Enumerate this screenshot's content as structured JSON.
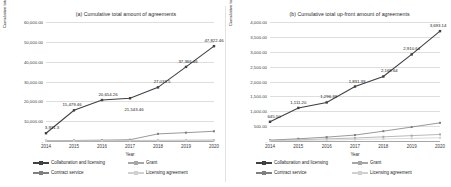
{
  "figure": {
    "background": "#ffffff",
    "series_colors": {
      "collaboration_and_licensing": "#404040",
      "contract_service": "#7f7f7f",
      "grant": "#a6a6a6",
      "licensing_agreement": "#d0d0d0"
    }
  },
  "chart_data": [
    {
      "type": "line",
      "panel": "a",
      "title": "(a) Cumulative total amount of agreements",
      "xlabel": "Year",
      "ylabel": "Cumulative total amount, $ million",
      "categories": [
        "2014",
        "2015",
        "2016",
        "2017",
        "2018",
        "2019",
        "2020"
      ],
      "ylim": [
        0,
        60000
      ],
      "yticks": [
        "-",
        "10,000.00",
        "20,000.00",
        "30,000.00",
        "40,000.00",
        "50,000.00",
        "60,000.00"
      ],
      "ytick_values": [
        0,
        10000,
        20000,
        30000,
        40000,
        50000,
        60000
      ],
      "grid": true,
      "legend_position": "bottom",
      "series": [
        {
          "name": "Collaboration and licensing",
          "color": "#404040",
          "values": [
            3931.3,
            15479.46,
            20654.26,
            21543.46,
            27033.5,
            37366.46,
            47822.46
          ],
          "data_labels": [
            "3,931.3",
            "15,479.46",
            "20,654.26",
            "21,543.46",
            "27,033.5",
            "37,366.46",
            "47,822.46"
          ]
        },
        {
          "name": "Contract service",
          "color": "#7f7f7f",
          "values": [
            120,
            260,
            420,
            640,
            3600,
            4200,
            4900
          ],
          "data_labels": []
        },
        {
          "name": "Grant",
          "color": "#a6a6a6",
          "values": [
            60,
            120,
            190,
            260,
            330,
            400,
            470
          ],
          "data_labels": []
        },
        {
          "name": "Licensing agreement",
          "color": "#d0d0d0",
          "values": [
            30,
            70,
            110,
            150,
            190,
            230,
            270
          ],
          "data_labels": []
        }
      ]
    },
    {
      "type": "line",
      "panel": "b",
      "title": "(b) Cumulative total up-front amount of agreements",
      "xlabel": "Year",
      "ylabel": "Cumulative total up-front amount, $ million",
      "categories": [
        "2014",
        "2015",
        "2016",
        "2017",
        "2018",
        "2019",
        "2020"
      ],
      "ylim": [
        0,
        4000
      ],
      "yticks": [
        "-",
        "500.00",
        "1,000.00",
        "1,500.00",
        "2,000.00",
        "2,500.00",
        "3,000.00",
        "3,500.00",
        "4,000.00"
      ],
      "ytick_values": [
        0,
        500,
        1000,
        1500,
        2000,
        2500,
        3000,
        3500,
        4000
      ],
      "grid": true,
      "legend_position": "bottom",
      "series": [
        {
          "name": "Collaboration and licensing",
          "color": "#404040",
          "values": [
            645.5,
            1111.2,
            1296.39,
            1831.39,
            2168.64,
            2910.64,
            3693.14
          ],
          "data_labels": [
            "645.50",
            "1,111.20",
            "1,296.39",
            "1,831.39",
            "2,168.64",
            "2,910.64",
            "3,693.14"
          ]
        },
        {
          "name": "Contract service",
          "color": "#7f7f7f",
          "values": [
            30,
            75,
            130,
            200,
            330,
            470,
            610
          ],
          "data_labels": []
        },
        {
          "name": "Grant",
          "color": "#a6a6a6",
          "values": [
            15,
            40,
            70,
            100,
            140,
            180,
            220
          ],
          "data_labels": []
        },
        {
          "name": "Licensing agreement",
          "color": "#d0d0d0",
          "values": [
            8,
            20,
            34,
            50,
            68,
            88,
            110
          ],
          "data_labels": []
        }
      ]
    }
  ],
  "legend": {
    "items": [
      "Collaboration and licensing",
      "Contract service",
      "Grant",
      "Licensing agreement"
    ]
  }
}
